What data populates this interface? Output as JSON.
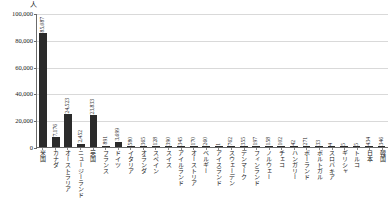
{
  "chart_data": {
    "type": "bar",
    "title": "",
    "xlabel": "",
    "ylabel": "人",
    "unit_label": "人",
    "ylim": [
      0,
      100000
    ],
    "yticks": [
      0,
      20000,
      40000,
      60000,
      80000,
      100000
    ],
    "ytick_labels": [
      "0",
      "20,000",
      "40,000",
      "60,000",
      "80,000",
      "100,000"
    ],
    "grid": true,
    "legend": "none",
    "bar_color": "#2b2b2b",
    "categories": [
      "米国",
      "カナダ",
      "オーストラリア",
      "ニュージーランド",
      "英国",
      "フランス",
      "ドイツ",
      "イタリア",
      "オランダ",
      "スペイン",
      "スイス",
      "アイルランド",
      "オーストリア",
      "ベルギー",
      "アイスランド",
      "スウェーデン",
      "デンマーク",
      "フィンランド",
      "ノルウェー",
      "チェコ",
      "ハンガリー",
      "ポーランド",
      "ポルトガル",
      "スロバキア",
      "ギリシャ",
      "トルコ",
      "日本",
      "韓国"
    ],
    "values": [
      85087,
      7176,
      24523,
      2452,
      23833,
      891,
      3699,
      580,
      365,
      128,
      390,
      345,
      170,
      260,
      1,
      762,
      355,
      197,
      158,
      102,
      42,
      271,
      33,
      4,
      5,
      5,
      434,
      346
    ],
    "value_labels": [
      "85,087",
      "7,176",
      "24,523",
      "2,452",
      "23,833",
      "891",
      "3,699",
      "580",
      "365",
      "128",
      "390",
      "345",
      "170",
      "260",
      "1",
      "762",
      "355",
      "197",
      "158",
      "102",
      "42",
      "271",
      "33",
      "4",
      "5",
      "5",
      "434",
      "346"
    ]
  }
}
